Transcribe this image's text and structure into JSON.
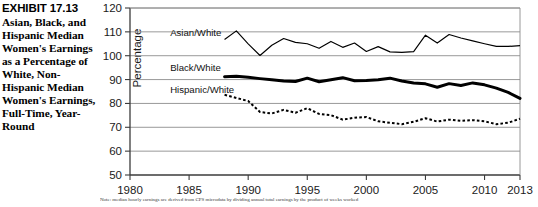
{
  "exhibit": {
    "number": "EXHIBIT 17.13",
    "caption": "Asian, Black, and Hispanic Median Women's Earnings as a Percentage of White, Non-Hispanic Median Women's Earnings, Full-Time, Year-Round"
  },
  "note": "Note: median hourly earnings are derived from CPS microdata by dividing annual total earnings by the product of weeks worked",
  "chart_data": {
    "type": "line",
    "title": "",
    "xlabel": "",
    "ylabel": "Percentage",
    "xlim": [
      1980,
      2013
    ],
    "ylim": [
      50,
      120
    ],
    "ytick_labels": [
      "50",
      "60",
      "70",
      "80",
      "90",
      "100",
      "110",
      "120"
    ],
    "yticks": [
      50,
      60,
      70,
      80,
      90,
      100,
      110,
      120
    ],
    "xtick_labels": [
      "1980",
      "1985",
      "1990",
      "1995",
      "2000",
      "2005",
      "2010",
      "2013"
    ],
    "xticks": [
      1980,
      1985,
      1990,
      1995,
      2000,
      2005,
      2010,
      2013
    ],
    "grid": true,
    "legend_position": "inline-labels",
    "series": [
      {
        "name": "Asian/White",
        "style": "thin-solid",
        "label_x": 1983.4,
        "label_y": 108.2,
        "x": [
          1988,
          1989,
          1990,
          1991,
          1992,
          1993,
          1994,
          1995,
          1996,
          1997,
          1998,
          1999,
          2000,
          2001,
          2002,
          2003,
          2004,
          2005,
          2006,
          2007,
          2008,
          2009,
          2010,
          2011,
          2012,
          2013
        ],
        "values": [
          106.8,
          110.4,
          105.0,
          100.1,
          104.4,
          107.2,
          105.6,
          105.0,
          103.1,
          106.0,
          103.5,
          105.3,
          101.8,
          103.8,
          101.6,
          101.4,
          101.7,
          108.6,
          105.3,
          108.9,
          107.4,
          106.2,
          105.0,
          103.9,
          103.9,
          104.2
        ]
      },
      {
        "name": "Black/White",
        "style": "thick-solid",
        "label_x": 1983.4,
        "label_y": 93.6,
        "x": [
          1988,
          1989,
          1990,
          1991,
          1992,
          1993,
          1994,
          1995,
          1996,
          1997,
          1998,
          1999,
          2000,
          2001,
          2002,
          2003,
          2004,
          2005,
          2006,
          2007,
          2008,
          2009,
          2010,
          2011,
          2012,
          2013
        ],
        "values": [
          91.2,
          91.4,
          91.0,
          90.4,
          89.9,
          89.4,
          89.2,
          90.6,
          89.1,
          89.9,
          90.8,
          89.5,
          89.6,
          89.9,
          90.6,
          89.4,
          88.6,
          88.2,
          86.8,
          88.3,
          87.5,
          88.6,
          87.8,
          86.4,
          84.6,
          82.1
        ]
      },
      {
        "name": "Hispanic/White",
        "style": "dotted",
        "label_x": 1983.4,
        "label_y": 84.5,
        "x": [
          1988,
          1989,
          1990,
          1991,
          1992,
          1993,
          1994,
          1995,
          1996,
          1997,
          1998,
          1999,
          2000,
          2001,
          2002,
          2003,
          2004,
          2005,
          2006,
          2007,
          2008,
          2009,
          2010,
          2011,
          2012,
          2013
        ],
        "values": [
          83.6,
          82.3,
          81.0,
          76.4,
          75.8,
          77.3,
          76.1,
          78.0,
          75.6,
          75.1,
          73.2,
          74.0,
          74.3,
          72.5,
          71.9,
          71.3,
          72.3,
          73.8,
          72.4,
          73.2,
          72.7,
          73.0,
          72.5,
          71.3,
          71.9,
          73.6
        ]
      }
    ]
  }
}
